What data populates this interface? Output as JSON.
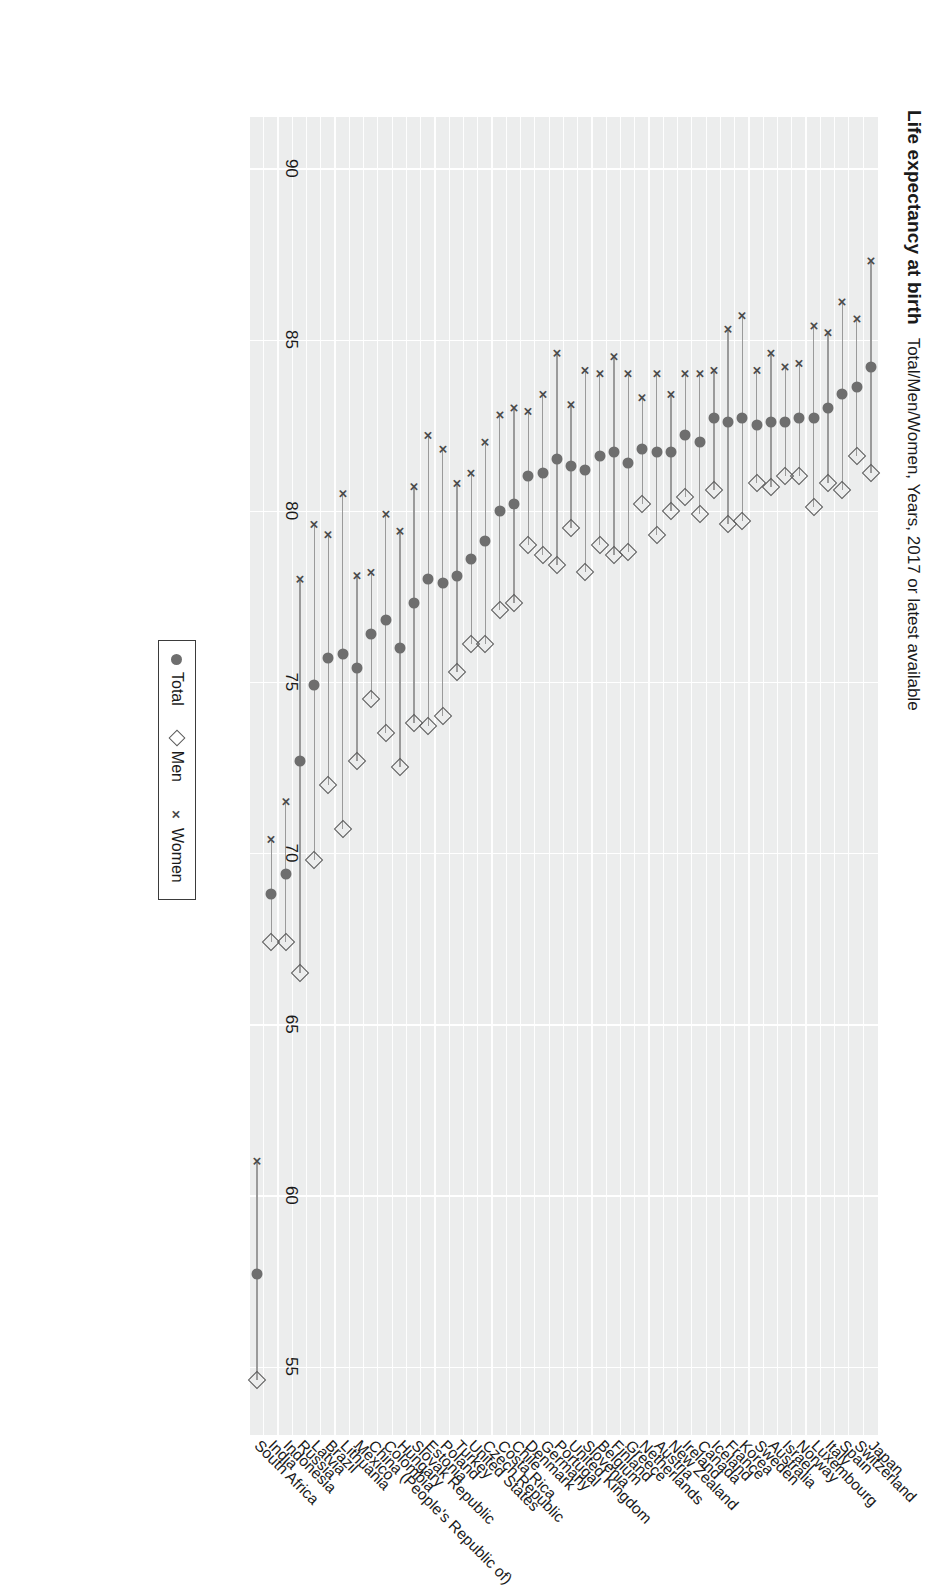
{
  "title": {
    "main": "Life expectancy at birth",
    "sub": "Total/Men/Women, Years, 2017 or latest available"
  },
  "legend": {
    "position": "bottom-center",
    "items": [
      {
        "label": "Total",
        "marker": "filled-circle-icon"
      },
      {
        "label": "Men",
        "marker": "open-diamond-icon"
      },
      {
        "label": "Women",
        "marker": "cross-x-icon"
      }
    ]
  },
  "axis": {
    "ticks": [
      "90",
      "85",
      "80",
      "75",
      "70",
      "65",
      "60",
      "55"
    ],
    "min": 53,
    "max": 91.5,
    "reversed": true
  },
  "chart_data": {
    "type": "scatter",
    "title": "Life expectancy at birth",
    "subtitle": "Total/Men/Women, Years, 2017 or latest available",
    "xlabel": "",
    "ylabel": "Years",
    "ylim": [
      53,
      91.5
    ],
    "grid": true,
    "legend_position": "bottom-center",
    "categories": [
      "Japan",
      "Switzerland",
      "Spain",
      "Italy",
      "Luxembourg",
      "Norway",
      "Israel",
      "Australia",
      "Sweden",
      "Korea",
      "France",
      "Iceland",
      "Canada",
      "Ireland",
      "New Zealand",
      "Austria",
      "Netherlands",
      "Greece",
      "Finland",
      "Belgium",
      "Slovenia",
      "United Kingdom",
      "Portugal",
      "Germany",
      "Denmark",
      "Chile",
      "Costa Rica",
      "Czech Republic",
      "United States",
      "Turkey",
      "Poland",
      "Estonia",
      "Slovak Republic",
      "Hungary",
      "Colombia",
      "China (People's Republic of)",
      "Mexico",
      "Lithuania",
      "Brazil",
      "Latvia",
      "Russia",
      "Indonesia",
      "India",
      "South Africa"
    ],
    "series": [
      {
        "name": "Total",
        "marker": "filled-circle",
        "values": [
          84.2,
          83.6,
          83.4,
          83.0,
          82.7,
          82.7,
          82.6,
          82.6,
          82.5,
          82.7,
          82.6,
          82.7,
          82.0,
          82.2,
          81.7,
          81.7,
          81.8,
          81.4,
          81.7,
          81.6,
          81.2,
          81.3,
          81.5,
          81.1,
          81.0,
          80.2,
          80.0,
          79.1,
          78.6,
          78.1,
          77.9,
          78.0,
          77.3,
          76.0,
          76.8,
          76.4,
          75.4,
          75.8,
          75.7,
          74.9,
          72.7,
          69.4,
          68.8,
          57.7
        ]
      },
      {
        "name": "Men",
        "marker": "open-diamond",
        "values": [
          81.1,
          81.6,
          80.6,
          80.8,
          80.1,
          81.0,
          81.0,
          80.7,
          80.8,
          79.7,
          79.6,
          80.6,
          79.9,
          80.4,
          80.0,
          79.3,
          80.2,
          78.8,
          78.7,
          79.0,
          78.2,
          79.5,
          78.4,
          78.7,
          79.0,
          77.3,
          77.1,
          76.1,
          76.1,
          75.3,
          74.0,
          73.7,
          73.8,
          72.5,
          73.5,
          74.5,
          72.7,
          70.7,
          72.0,
          69.8,
          66.5,
          67.4,
          67.4,
          54.6
        ]
      },
      {
        "name": "Women",
        "marker": "cross-x",
        "values": [
          87.3,
          85.6,
          86.1,
          85.2,
          85.4,
          84.3,
          84.2,
          84.6,
          84.1,
          85.7,
          85.3,
          84.1,
          84.0,
          84.0,
          83.4,
          84.0,
          83.3,
          84.0,
          84.5,
          84.0,
          84.1,
          83.1,
          84.6,
          83.4,
          82.9,
          83.0,
          82.8,
          82.0,
          81.1,
          80.8,
          81.8,
          82.2,
          80.7,
          79.4,
          79.9,
          78.2,
          78.1,
          80.5,
          79.3,
          79.6,
          78.0,
          71.5,
          70.4,
          61.0
        ]
      }
    ]
  }
}
